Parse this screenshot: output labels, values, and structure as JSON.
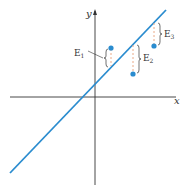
{
  "diagram": {
    "type": "least-squares residual illustration",
    "axes": {
      "x_label": "x",
      "y_label": "y"
    },
    "line": {
      "color": "#2a8ccf",
      "from": [
        10,
        173
      ],
      "to": [
        166,
        10
      ]
    },
    "points": [
      {
        "label": "E",
        "sub": "1",
        "point": [
          111,
          48
        ],
        "line_y": 66
      },
      {
        "label": "E",
        "sub": "2",
        "point": [
          133,
          74
        ],
        "line_y": 44
      },
      {
        "label": "E",
        "sub": "3",
        "point": [
          154,
          46
        ],
        "line_y": 22
      }
    ],
    "colors": {
      "point": "#2a8ccf",
      "residual": "#e8a07a",
      "axis": "#333333"
    }
  }
}
